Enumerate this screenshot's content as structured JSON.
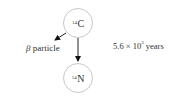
{
  "diagram": {
    "nodes": [
      {
        "id": "carbon-14",
        "mass_number": "14",
        "symbol": "C"
      },
      {
        "id": "nitrogen-14",
        "mass_number": "14",
        "symbol": "N"
      }
    ],
    "edges": [
      {
        "from": "carbon-14",
        "to": "nitrogen-14"
      },
      {
        "from": "carbon-14",
        "to": "beta-particle"
      }
    ],
    "beta_label": {
      "greek": "β",
      "text": "particle"
    },
    "half_life": {
      "mantissa": "5.6",
      "times": "×",
      "base": "10",
      "exponent": "3",
      "unit": "years"
    }
  }
}
